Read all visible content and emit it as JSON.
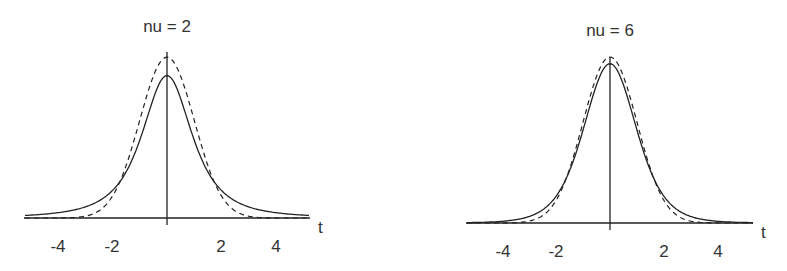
{
  "chart_data": [
    {
      "type": "line",
      "title": "nu = 2",
      "xlabel": "t",
      "ylabel": "",
      "xlim": [
        -5.2,
        5.2
      ],
      "ylim": [
        0,
        0.42
      ],
      "x_ticks": [
        -4,
        -2,
        2,
        4
      ],
      "x_tick_labels": [
        "-4",
        "-2",
        "2",
        "4"
      ],
      "grid": false,
      "legend": null,
      "series": [
        {
          "name": "Student t density (nu = 2)",
          "style": "solid",
          "peak": 0.354,
          "function": "t_pdf",
          "nu": 2
        },
        {
          "name": "Standard normal density",
          "style": "dashed",
          "peak": 0.399,
          "function": "normal_pdf"
        }
      ]
    },
    {
      "type": "line",
      "title": "nu = 6",
      "xlabel": "t",
      "ylabel": "",
      "xlim": [
        -5.2,
        5.2
      ],
      "ylim": [
        0,
        0.42
      ],
      "x_ticks": [
        -4,
        -2,
        2,
        4
      ],
      "x_tick_labels": [
        "-4",
        "-2",
        "2",
        "4"
      ],
      "grid": false,
      "legend": null,
      "series": [
        {
          "name": "Student t density (nu = 6)",
          "style": "solid",
          "peak": 0.383,
          "function": "t_pdf",
          "nu": 6
        },
        {
          "name": "Standard normal density",
          "style": "dashed",
          "peak": 0.399,
          "function": "normal_pdf"
        }
      ]
    }
  ],
  "panels": [
    {
      "title": "nu = 2",
      "axis_label": "t",
      "ticks": [
        "-4",
        "-2",
        "2",
        "4"
      ]
    },
    {
      "title": "nu = 6",
      "axis_label": "t",
      "ticks": [
        "-4",
        "-2",
        "2",
        "4"
      ]
    }
  ]
}
